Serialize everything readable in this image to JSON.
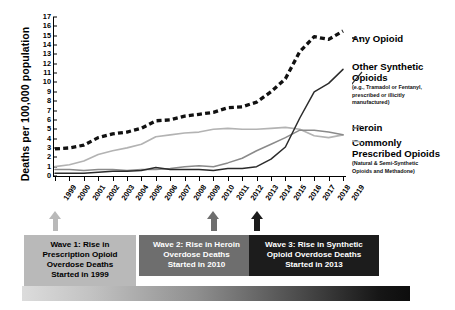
{
  "chart_data": {
    "type": "line",
    "title": "",
    "xlabel": "",
    "ylabel": "Deaths per 100,000 population",
    "ylim": [
      0,
      17
    ],
    "ytick_labels": [
      "0",
      "1",
      "2",
      "3",
      "4",
      "5",
      "6",
      "7",
      "8",
      "9",
      "10",
      "11",
      "12",
      "13",
      "14",
      "15",
      "16",
      "17"
    ],
    "grid": false,
    "legend_position": "right",
    "x": [
      "1999",
      "2000",
      "2001",
      "2002",
      "2003",
      "2004",
      "2005",
      "2006",
      "2007",
      "2008",
      "2009",
      "2010",
      "2011",
      "2012",
      "2013",
      "2014",
      "2015",
      "2016",
      "2017",
      "2018",
      "2019"
    ],
    "series": [
      {
        "name": "Any Opioid",
        "style": "dashed-thick-black",
        "color": "#111111",
        "values": [
          2.9,
          3.0,
          3.3,
          4.1,
          4.5,
          4.7,
          5.1,
          5.9,
          6.0,
          6.4,
          6.6,
          6.8,
          7.3,
          7.4,
          7.9,
          9.0,
          10.4,
          13.3,
          14.9,
          14.6,
          15.5
        ]
      },
      {
        "name": "Commonly Prescribed Opioids",
        "sub": "(Natural & Semi-Synthetic Opioids and Methadone)",
        "style": "solid-light-gray",
        "color": "#b3b3b3",
        "values": [
          1.0,
          1.2,
          1.6,
          2.3,
          2.7,
          3.0,
          3.4,
          4.2,
          4.4,
          4.6,
          4.7,
          5.0,
          5.1,
          5.0,
          5.0,
          5.1,
          5.2,
          5.0,
          4.3,
          4.1,
          4.4
        ]
      },
      {
        "name": "Heroin",
        "style": "solid-mid-gray",
        "color": "#8a8a8a",
        "values": [
          0.7,
          0.7,
          0.6,
          0.7,
          0.7,
          0.6,
          0.7,
          0.7,
          0.8,
          1.0,
          1.1,
          1.0,
          1.4,
          1.9,
          2.7,
          3.4,
          4.1,
          4.9,
          4.9,
          4.7,
          4.4
        ]
      },
      {
        "name": "Other Synthetic Opioids",
        "sub": "(e.g., Tramadol or Fentanyl, prescribed or illicitly manufactured)",
        "style": "solid-dark",
        "color": "#2b2b2b",
        "values": [
          0.3,
          0.3,
          0.3,
          0.4,
          0.5,
          0.5,
          0.6,
          0.9,
          0.7,
          0.7,
          0.7,
          0.6,
          0.8,
          0.8,
          1.0,
          1.8,
          3.1,
          6.2,
          9.0,
          9.9,
          11.4
        ]
      }
    ]
  },
  "axis": {
    "y_title": "Deaths per 100,000 population"
  },
  "legend": {
    "any_opioid": {
      "title": "Any Opioid",
      "sub": ""
    },
    "other_synthetic": {
      "title_line1": "Other Synthetic",
      "title_line2": "Opioids",
      "sub_line1": "(e.g., Tramadol or Fentanyl,",
      "sub_line2": "prescribed or illicitly",
      "sub_line3": "manufactured)"
    },
    "heroin": {
      "title": "Heroin"
    },
    "commonly_prescribed": {
      "title_line1": "Commonly",
      "title_line2": "Prescribed Opioids",
      "sub_line1": "(Natural & Semi-Synthetic",
      "sub_line2": "Opioids and Methadone)"
    }
  },
  "waves": [
    {
      "id": "wave-1",
      "line1": "Wave 1: Rise in",
      "line2": "Prescription Opioid",
      "line3": "Overdose Deaths",
      "line4": "Started in 1999",
      "year": "1999",
      "bg": "#b9b9b9",
      "fg": "#000000"
    },
    {
      "id": "wave-2",
      "line1": "Wave 2: Rise in Heroin",
      "line2": "Overdose Deaths",
      "line3": "Started in 2010",
      "line4": "",
      "year": "2010",
      "bg": "#6e6e6e",
      "fg": "#ffffff"
    },
    {
      "id": "wave-3",
      "line1": "Wave 3: Rise in Synthetic",
      "line2": "Opioid Overdose Deaths",
      "line3": "Started in 2013",
      "line4": "",
      "year": "2013",
      "bg": "#1c1c1c",
      "fg": "#ffffff"
    }
  ],
  "colors": {
    "any_opioid": "#111111",
    "other_synthetic": "#2b2b2b",
    "heroin": "#8a8a8a",
    "commonly_prescribed": "#b3b3b3",
    "wave1": "#b9b9b9",
    "wave2": "#6e6e6e",
    "wave3": "#1c1c1c"
  }
}
